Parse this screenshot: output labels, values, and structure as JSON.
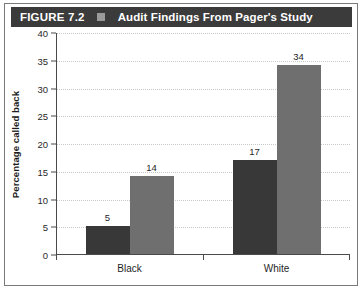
{
  "figure": {
    "number_label": "FIGURE 7.2",
    "separator_icon": "square-bullet-icon",
    "title": "Audit Findings From Pager's Study",
    "header_bg": "#3b3b3b",
    "header_text_color": "#ffffff"
  },
  "chart_data": {
    "type": "bar",
    "title": "Audit Findings From Pager's Study",
    "xlabel": "",
    "ylabel": "Percentage called back",
    "categories": [
      "Black",
      "White"
    ],
    "ylim": [
      0,
      40
    ],
    "yticks": [
      0,
      5,
      10,
      15,
      20,
      25,
      30,
      35,
      40
    ],
    "ytick_labels": [
      "0",
      "5",
      "10",
      "15",
      "20",
      "25",
      "30",
      "35",
      "40"
    ],
    "grid": true,
    "grid_style": "dotted-horizontal",
    "legend": "none",
    "series": [
      {
        "name": "Criminal record",
        "color": "#383838",
        "values": [
          5,
          17
        ],
        "value_labels": [
          "5",
          "17"
        ]
      },
      {
        "name": "No criminal record",
        "color": "#6f6f6f",
        "values": [
          14,
          34
        ],
        "value_labels": [
          "14",
          "34"
        ]
      }
    ]
  },
  "colors": {
    "dark_bar": "#383838",
    "light_bar": "#6f6f6f",
    "axis": "#4a4a4a",
    "gridline": "#c9c9c9",
    "frame": "#7a7a7a"
  }
}
